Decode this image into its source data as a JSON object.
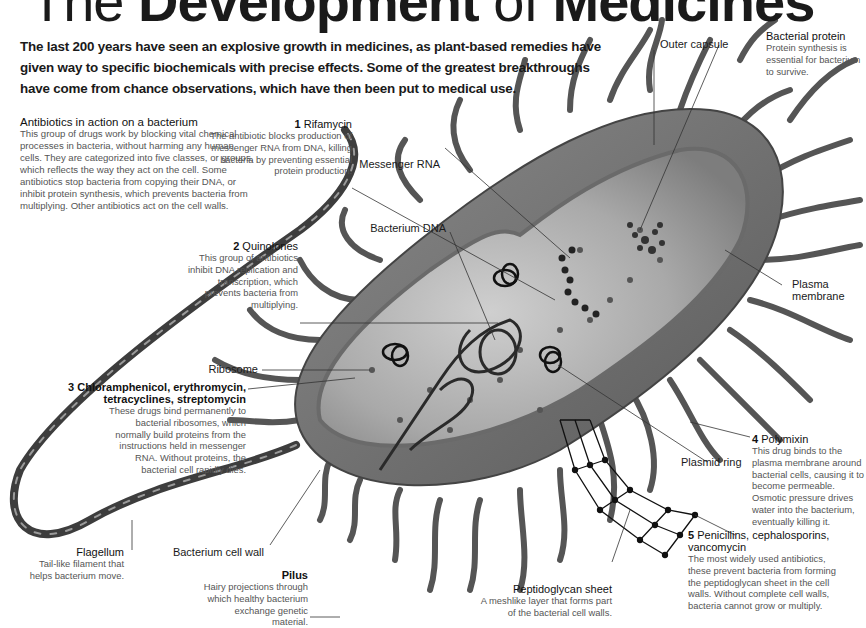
{
  "title": {
    "part1": "The ",
    "part2": "Development",
    "part3": " of ",
    "part4": "Medicines"
  },
  "intro": "The last 200 years have seen an explosive growth in medicines, as plant-based remedies have given way to specific biochemicals with precise effects. Some of the greatest breakthroughs have come from chance observations, which have then been put to medical use.",
  "overview": {
    "heading": "Antibiotics in action on a bacterium",
    "text": "This group of drugs work by blocking vital chemical processes in bacteria, without harming any human cells. They are categorized into five classes, or groups, which reflects the way they act on the cell. Some antibiotics stop bacteria from copying their DNA, or inhibit protein synthesis, which prevents bacteria from multiplying. Other antibiotics act on the cell walls."
  },
  "antibiotics": [
    {
      "num": "1",
      "name": "Rifamycin",
      "text": "The antibiotic blocks production of messenger RNA from DNA, killing bacteria by preventing essential protein production."
    },
    {
      "num": "2",
      "name": "Quinolones",
      "text": "This group of antibiotics inhibit DNA replication and transcription, which prevents bacteria from multiplying."
    },
    {
      "num": "3",
      "name": "Chloramphenicol, erythromycin, tetracyclines, streptomycin",
      "text": "These drugs bind permanently to bacterial ribosomes, which normally build proteins from the instructions held in messenger RNA. Without proteins, the bacterial cell rapidly dies."
    },
    {
      "num": "4",
      "name": "Polymixin",
      "text": "This drug binds to the plasma membrane around bacterial cells, causing it to become permeable. Osmotic pressure drives water into the bacterium, eventually killing it."
    },
    {
      "num": "5",
      "name": "Penicillins, cephalosporins, vancomycin",
      "text": "The most widely used antibiotics, these prevent bacteria from forming the peptidoglycan sheet in the cell walls. Without complete cell walls, bacteria cannot grow or multiply."
    }
  ],
  "parts": {
    "messenger_rna": "Messenger RNA",
    "bacterium_dna": "Bacterium DNA",
    "ribosome": "Ribosome",
    "outer_capsule": "Outer capsule",
    "plasma_membrane": "Plasma membrane",
    "plasmid_ring": "Plasmid ring",
    "bacterium_cell_wall": "Bacterium cell wall",
    "bacterial_protein": {
      "name": "Bacterial protein",
      "text": "Protein synthesis is essential for bacterium to survive."
    },
    "flagellum": {
      "name": "Flagellum",
      "text": "Tail-like filament that helps bacterium move."
    },
    "pilus": {
      "name": "Pilus",
      "text": "Hairy projections through which healthy bacterium exchange genetic material."
    },
    "peptidoglycan": {
      "name": "Peptidoglycan sheet",
      "text": "A meshlike layer that forms part of the bacterial cell walls."
    }
  }
}
